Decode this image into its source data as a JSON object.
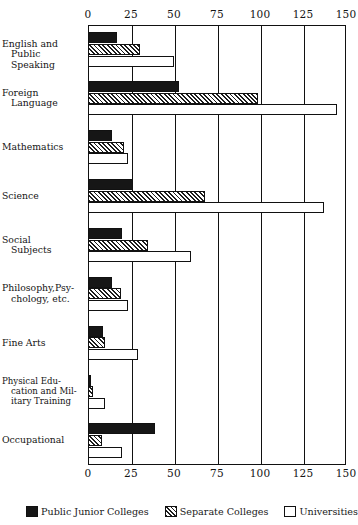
{
  "chart_data": {
    "type": "bar",
    "orientation": "horizontal",
    "title": "",
    "xlabel": "",
    "ylabel": "",
    "xlim": [
      0,
      150
    ],
    "xticks": [
      0,
      25,
      50,
      75,
      100,
      125,
      150
    ],
    "xtick_labels": [
      "0",
      "25",
      "50",
      "75",
      "100",
      "125",
      "150"
    ],
    "grid": true,
    "grid_axis": "x",
    "legend_position": "bottom",
    "categories": [
      "English and Public Speaking",
      "Foreign Language",
      "Mathematics",
      "Science",
      "Social Subjects",
      "Philosophy, Psychology, etc.",
      "Fine Arts",
      "Physical Education and Military Training",
      "Occupational"
    ],
    "category_lines": [
      [
        "English and",
        "Public Speaking"
      ],
      [
        "Foreign",
        "Language"
      ],
      [
        "Mathematics"
      ],
      [
        "Science"
      ],
      [
        "Social",
        "Subjects"
      ],
      [
        "Philosophy,Psy-",
        "chology, etc."
      ],
      [
        "Fine Arts"
      ],
      [
        "Physical Edu-",
        "cation and Mil-",
        "itary Training"
      ],
      [
        "Occupational"
      ]
    ],
    "series": [
      {
        "name": "Public Junior Colleges",
        "fill": "solid-black",
        "color": "#161616",
        "values": [
          17,
          53,
          14,
          26,
          20,
          14,
          9,
          2,
          39
        ]
      },
      {
        "name": "Separate Colleges",
        "fill": "diagonal-hatch",
        "color": "#1d1d1d",
        "values": [
          30,
          99,
          21,
          68,
          35,
          19,
          10,
          3,
          8
        ]
      },
      {
        "name": "Universities",
        "fill": "white",
        "color": "#ffffff",
        "values": [
          50,
          145,
          23,
          137,
          60,
          23,
          29,
          10,
          20
        ]
      }
    ]
  },
  "legend": {
    "items": [
      {
        "label": "Public Junior Colleges",
        "swatch": "solid-black"
      },
      {
        "label": "Separate Colleges",
        "swatch": "diagonal-hatch"
      },
      {
        "label": "Universities",
        "swatch": "white"
      }
    ]
  }
}
